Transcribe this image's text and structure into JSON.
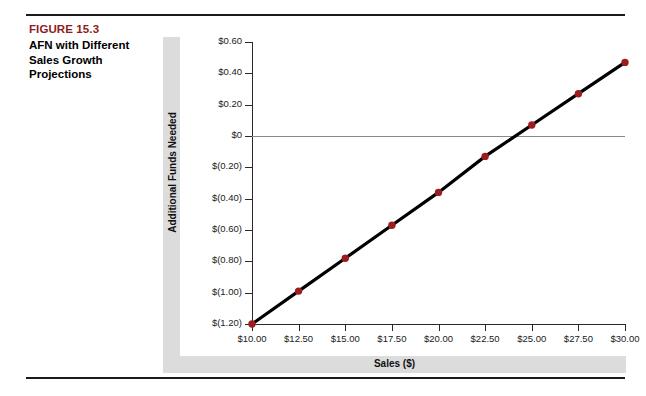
{
  "caption": {
    "figure_number": "FIGURE 15.3",
    "title": "AFN with Different Sales Growth Projections"
  },
  "colors": {
    "figure_number": "#8c1d22",
    "marker": "#9c1d20",
    "line": "#000000",
    "band": "#dcdcdc",
    "zero_line": "#8a8a8a",
    "axis": "#2a2a2a"
  },
  "chart_data": {
    "type": "line",
    "title": "AFN with Different Sales Growth Projections",
    "xlabel": "Sales ($)",
    "ylabel": "Additional Funds Needed",
    "x": [
      10.0,
      12.5,
      15.0,
      17.5,
      20.0,
      22.5,
      25.0,
      27.5,
      30.0
    ],
    "values": [
      -1.2,
      -0.99,
      -0.78,
      -0.57,
      -0.36,
      -0.13,
      0.07,
      0.27,
      0.47
    ],
    "series": [
      {
        "name": "Additional Funds Needed",
        "values": [
          -1.2,
          -0.99,
          -0.78,
          -0.57,
          -0.36,
          -0.13,
          0.07,
          0.27,
          0.47
        ]
      }
    ],
    "xlim": [
      10.0,
      30.0
    ],
    "ylim": [
      -1.2,
      0.6
    ],
    "xticks": [
      10.0,
      12.5,
      15.0,
      17.5,
      20.0,
      22.5,
      25.0,
      27.5,
      30.0
    ],
    "yticks": [
      0.6,
      0.4,
      0.2,
      0.0,
      -0.2,
      -0.4,
      -0.6,
      -0.8,
      -1.0,
      -1.2
    ],
    "xticklabels": [
      "$10.00",
      "$12.50",
      "$15.00",
      "$17.50",
      "$20.00",
      "$22.50",
      "$25.00",
      "$27.50",
      "$30.00"
    ],
    "yticklabels": [
      "$0.60",
      "$0.40",
      "$0.20",
      "$0",
      "$(0.20)",
      "$(0.40)",
      "$(0.60)",
      "$(0.80)",
      "$(1.00)",
      "$(1.20)"
    ],
    "grid": false,
    "zero_reference_line": true,
    "legend": null,
    "marker": "circle",
    "marker_size": 6
  }
}
